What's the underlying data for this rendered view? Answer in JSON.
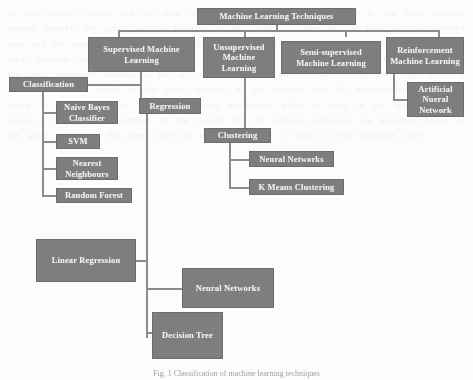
{
  "figure": {
    "caption": "Fig. 1  Classification of machine learning techniques",
    "box_fill": "#7e7e7e",
    "box_text_color": "#f2f2f2",
    "connector_color": "#8b8b8b",
    "background": "#fcfcfc"
  },
  "diagram": {
    "type": "tree",
    "root": "Machine Learning Techniques",
    "nodes": {
      "root": "Machine Learning Techniques",
      "supervised": "Supervised Machine Learning",
      "unsupervised": "Unsupervised Machine Learning",
      "semi_supervised": "Semi-supervised Machine Learning",
      "reinforcement": "Reinforcement Machine Learning",
      "ann": "Artificial Nueral Network",
      "classification": "Classification",
      "naive_bayes": "Naive Bayes Classifier",
      "svm": "SVM",
      "nearest_neighbours": "Nearest Neighbours",
      "random_forest": "Random Forest",
      "regression": "Regression",
      "clustering": "Clustering",
      "cluster_neural_networks": "Neural Networks",
      "k_means": "K Means Clustering",
      "linear_regression": "Linear Regression",
      "reg_neural_networks": "Neural Networks",
      "decision_tree": "Decision Tree"
    },
    "edges": [
      [
        "root",
        "supervised"
      ],
      [
        "root",
        "unsupervised"
      ],
      [
        "root",
        "semi_supervised"
      ],
      [
        "root",
        "reinforcement"
      ],
      [
        "reinforcement",
        "ann"
      ],
      [
        "supervised",
        "classification"
      ],
      [
        "supervised",
        "regression"
      ],
      [
        "classification",
        "naive_bayes"
      ],
      [
        "classification",
        "svm"
      ],
      [
        "classification",
        "nearest_neighbours"
      ],
      [
        "classification",
        "random_forest"
      ],
      [
        "unsupervised",
        "clustering"
      ],
      [
        "clustering",
        "cluster_neural_networks"
      ],
      [
        "clustering",
        "k_means"
      ],
      [
        "regression",
        "linear_regression"
      ],
      [
        "regression",
        "reg_neural_networks"
      ],
      [
        "regression",
        "decision_tree"
      ]
    ]
  },
  "bleed_text": "of the various classes and the data used for the training of the model in the most efficient manner possible for given set the learning of the system is done by the label of the provided data and the output which is generated by the given model set of the techniques and the various other methods which are in use of the present system model and the other learning of model the semi supervised learning is the set of the both the labeled and the unlabeled data which is used to train the model in the given scenario of the problem and the reinforcement learning is based on the reward and the penalty based mechanism which is used in the learning of the agent in the given environment of the system and the various techniques are described below in the given section of the paper with the detail explanation of each of the technique used"
}
